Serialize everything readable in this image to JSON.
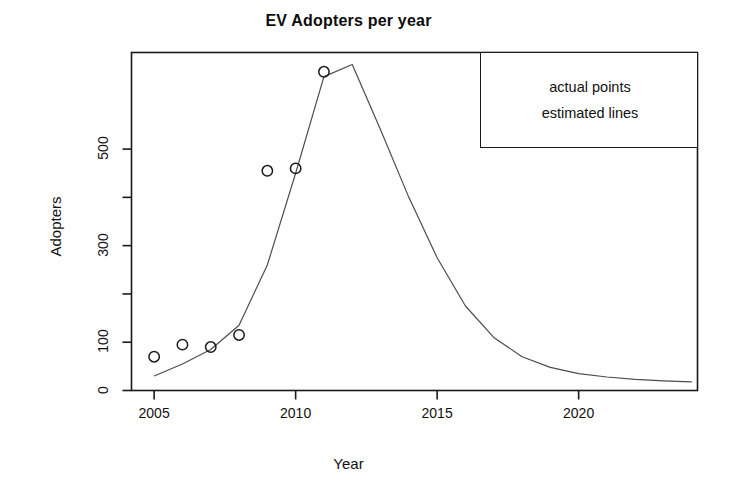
{
  "chart_data": {
    "type": "scatter",
    "title": "EV Adopters per year",
    "xlabel": "Year",
    "ylabel": "Adopters",
    "xlim": [
      2004.2,
      2024.2
    ],
    "ylim": [
      0,
      700
    ],
    "grid": false,
    "xticks": [
      2005,
      2010,
      2015,
      2020
    ],
    "xtick_labels": [
      "2005",
      "2010",
      "2015",
      "2020"
    ],
    "yticks": [
      0,
      100,
      200,
      300,
      400,
      500
    ],
    "ytick_labels": [
      "0",
      "100",
      "",
      "300",
      "",
      "500"
    ],
    "ytick_labels_shown": [
      "0",
      "100",
      "300",
      "500"
    ],
    "legend_position": "top-right",
    "legend_entries": [
      "actual points",
      "estimated lines"
    ],
    "series": [
      {
        "name": "actual points",
        "style": "points",
        "marker": "open-circle",
        "color": "#1a1a1a",
        "x": [
          2005,
          2006,
          2007,
          2008,
          2009,
          2010,
          2011
        ],
        "values": [
          70,
          95,
          90,
          115,
          455,
          460,
          660
        ]
      },
      {
        "name": "estimated lines",
        "style": "line",
        "color": "#4d4d4d",
        "x": [
          2005,
          2006,
          2007,
          2008,
          2009,
          2010,
          2011,
          2012,
          2013,
          2014,
          2015,
          2016,
          2017,
          2018,
          2019,
          2020,
          2021,
          2022,
          2023,
          2024
        ],
        "values": [
          30,
          55,
          85,
          135,
          260,
          450,
          650,
          675,
          540,
          400,
          275,
          175,
          110,
          70,
          48,
          35,
          28,
          23,
          20,
          18
        ]
      }
    ]
  },
  "legend": {
    "entries": [
      {
        "label": "actual points"
      },
      {
        "label": "estimated lines"
      }
    ]
  }
}
